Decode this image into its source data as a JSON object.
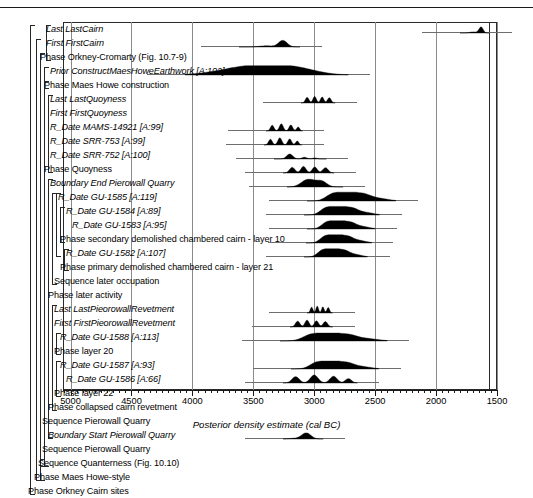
{
  "figure": {
    "x_caption": "Posterior density estimate (cal BC)",
    "axis": {
      "min": 1500,
      "max": 5200,
      "reversed": true,
      "major_ticks": [
        5000,
        4500,
        4000,
        3500,
        3000,
        2500,
        2000,
        1500
      ],
      "tick_labels": [
        "5000",
        "4500",
        "4000",
        "3500",
        "3000",
        "2500",
        "2000",
        "1500"
      ],
      "minor_tick_step": 50
    },
    "gridlines": [
      5000,
      4500,
      4000,
      3500,
      3000,
      2500,
      2000,
      1500
    ]
  },
  "chart_data": {
    "type": "line",
    "title": "",
    "subtitle": "",
    "xlabel": "Posterior density estimate (cal BC)",
    "ylabel": "",
    "xlim": [
      5200,
      1500
    ],
    "grid": true,
    "legend": null,
    "note": "OxCal Bayesian chronological model; each row is a posterior probability density (filled black) with a light tail marking the 95% range.",
    "categories": [
      "Last LastCairn",
      "First FirstCairn",
      "Phase Orkney-Cromarty (Fig. 10.7-9)",
      "Prior ConstructMaesHoweEarthwork [A:102]",
      "Phase Maes Howe construction",
      "Last LastQuoyness",
      "First FirstQuoyness",
      "R_Date MAMS-14921 [A:99]",
      "R_Date SRR-753 [A:99]",
      "R_Date SRR-752 [A:100]",
      "Phase Quoyness",
      "Boundary End Pierowall Quarry",
      "R_Date GU-1585 [A:119]",
      "R_Date GU-1584 [A:89]",
      "R_Date GU-1583 [A:95]",
      "Phase secondary demolished chambered cairn - layer 10",
      "R_Date GU-1582 [A:107]",
      "Phase primary demolished chambered cairn - layer 21",
      "Sequence later occupation",
      "Phase later activity",
      "Last LastPieorowallRevetment",
      "First FirstPieorowallRevetment",
      "R_Date GU-1588 [A:113]",
      "Phase layer 20",
      "R_Date GU-1587 [A:93]",
      "R_Date GU-1586 [A:66]",
      "Phase layer 22",
      "Phase collapsed cairn revetment",
      "Sequence Pierowall Quarry",
      "Boundary Start Pierowall Quarry",
      "Sequence Pierowall Quarry",
      "Sequence Quanterness (Fig. 10.10)",
      "Phase Maes Howe-style",
      "Phase Orkney Cairn sites"
    ],
    "series": [
      {
        "name": "Last LastCairn",
        "peak": 1650,
        "range95": [
          1800,
          1560
        ],
        "height": 0.55
      },
      {
        "name": "First FirstCairn",
        "peak": 3190,
        "range95": [
          3620,
          3120
        ],
        "height": 0.6
      },
      {
        "name": "Prior ConstructMaesHoweEarthwork [A:102]",
        "peak": 3180,
        "range95": [
          4060,
          2720
        ],
        "height": 0.85
      },
      {
        "name": "Last LastQuoyness",
        "peak": 2930,
        "range95": [
          3110,
          2830
        ],
        "height": 0.6
      },
      {
        "name": "R_Date MAMS-14921 [A:99]",
        "peak": 3330,
        "range95": [
          3400,
          3100
        ],
        "height": 0.65
      },
      {
        "name": "R_Date SRR-753 [A:99]",
        "peak": 3330,
        "range95": [
          3410,
          3100
        ],
        "height": 0.65
      },
      {
        "name": "R_Date SRR-752 [A:100]",
        "peak": 2980,
        "range95": [
          3330,
          2900
        ],
        "height": 0.45
      },
      {
        "name": "Boundary End Pierowall Quarry",
        "peak": 2950,
        "range95": [
          3220,
          2840
        ],
        "height": 0.65
      },
      {
        "name": "R_Date GU-1585 [A:119]",
        "peak": 2870,
        "range95": [
          3060,
          2620
        ],
        "height": 0.8
      },
      {
        "name": "R_Date GU-1584 [A:89]",
        "peak": 2890,
        "range95": [
          3080,
          2300
        ],
        "height": 0.8
      },
      {
        "name": "R_Date GU-1583 [A:95]",
        "peak": 2880,
        "range95": [
          3060,
          2450
        ],
        "height": 0.75
      },
      {
        "name": "R_Date GU-1582 [A:107]",
        "peak": 2870,
        "range95": [
          3070,
          2560
        ],
        "height": 0.75
      },
      {
        "name": "Sequence later occupation",
        "peak": 2890,
        "range95": [
          3070,
          2590
        ],
        "height": 0.8
      },
      {
        "name": "Last LastPieorowallRevetment",
        "peak": 2940,
        "range95": [
          3060,
          2850
        ],
        "height": 0.65
      },
      {
        "name": "First FirstPieorowallRevetment",
        "peak": 2930,
        "range95": [
          3200,
          2850
        ],
        "height": 0.65
      },
      {
        "name": "R_Date GU-1588 [A:113]",
        "peak": 2930,
        "range95": [
          3280,
          2400
        ],
        "height": 0.7
      },
      {
        "name": "R_Date GU-1587 [A:93]",
        "peak": 2930,
        "range95": [
          3190,
          2470
        ],
        "height": 0.7
      },
      {
        "name": "R_Date GU-1586 [A:66]",
        "peak": 2930,
        "range95": [
          3260,
          2650
        ],
        "height": 0.7
      },
      {
        "name": "Boundary Start Pierowall Quarry",
        "peak": 3030,
        "range95": [
          3260,
          2930
        ],
        "height": 0.55
      }
    ]
  },
  "rows": [
    {
      "label": "Last LastCairn",
      "italic": true,
      "indent": 46,
      "dist": {
        "mode": "narrow",
        "peak": 1650,
        "left": 1800,
        "right": 1560,
        "h": 0.55
      }
    },
    {
      "label": "First FirstCairn",
      "italic": true,
      "indent": 46,
      "dist": {
        "mode": "narrow",
        "peak": 3190,
        "left": 3620,
        "right": 3120,
        "h": 0.6
      }
    },
    {
      "label": "Phase Orkney-Cromarty (Fig. 10.7-9)",
      "italic": false,
      "indent": 40,
      "dist": null
    },
    {
      "label": "Prior ConstructMaesHoweEarthwork [A:102]",
      "italic": true,
      "indent": 50,
      "dist": {
        "mode": "wide",
        "peak": 3180,
        "left": 4060,
        "right": 2720,
        "h": 0.85
      }
    },
    {
      "label": "Phase Maes Howe construction",
      "italic": false,
      "indent": 44,
      "dist": null
    },
    {
      "label": "Last LastQuoyness",
      "italic": true,
      "indent": 50,
      "dist": {
        "mode": "bumpy",
        "peak": 2930,
        "left": 3110,
        "right": 2830,
        "h": 0.6
      }
    },
    {
      "label": "First FirstQuoyness",
      "italic": true,
      "indent": 50,
      "dist": null
    },
    {
      "label": "R_Date MAMS-14921 [A:99]",
      "italic": true,
      "indent": 50,
      "dist": {
        "mode": "tri",
        "peak": 3330,
        "left": 3400,
        "right": 3100,
        "h": 0.65
      }
    },
    {
      "label": "R_Date SRR-753 [A:99]",
      "italic": true,
      "indent": 50,
      "dist": {
        "mode": "tri",
        "peak": 3330,
        "left": 3410,
        "right": 3100,
        "h": 0.65
      }
    },
    {
      "label": "R_Date SRR-752 [A:100]",
      "italic": true,
      "indent": 50,
      "dist": {
        "mode": "small",
        "peak": 2980,
        "left": 3330,
        "right": 2900,
        "h": 0.45
      }
    },
    {
      "label": "Phase Quoyness",
      "italic": false,
      "indent": 44,
      "dist": {
        "mode": "bumpy",
        "peak": 2940,
        "left": 3260,
        "right": 2840,
        "h": 0.6
      }
    },
    {
      "label": "Boundary End Pierowall Quarry",
      "italic": true,
      "indent": 50,
      "dist": {
        "mode": "broad",
        "peak": 2950,
        "left": 3220,
        "right": 2760,
        "h": 0.7
      }
    },
    {
      "label": "R_Date GU-1585 [A:119]",
      "italic": true,
      "indent": 58,
      "dist": {
        "mode": "broad2",
        "peak": 2870,
        "left": 3060,
        "right": 2330,
        "h": 0.8
      }
    },
    {
      "label": "R_Date GU-1584 [A:89]",
      "italic": true,
      "indent": 66,
      "dist": {
        "mode": "broad2",
        "peak": 2890,
        "left": 3080,
        "right": 2460,
        "h": 0.78
      }
    },
    {
      "label": "R_Date GU-1583 [A:95]",
      "italic": true,
      "indent": 72,
      "dist": {
        "mode": "broad2",
        "peak": 2880,
        "left": 3060,
        "right": 2500,
        "h": 0.75
      }
    },
    {
      "label": "Phase secondary demolished chambered cairn - layer 10",
      "italic": false,
      "indent": 60,
      "dist": {
        "mode": "broad2",
        "peak": 2870,
        "left": 3070,
        "right": 2530,
        "h": 0.75
      }
    },
    {
      "label": "R_Date GU-1582 [A:107]",
      "italic": true,
      "indent": 66,
      "dist": {
        "mode": "broad2",
        "peak": 2870,
        "left": 3080,
        "right": 2560,
        "h": 0.75
      }
    },
    {
      "label": "Phase primary demolished chambered cairn - layer 21",
      "italic": false,
      "indent": 60,
      "dist": null
    },
    {
      "label": "Sequence later occupation",
      "italic": false,
      "indent": 54,
      "dist": null
    },
    {
      "label": "Phase later activity",
      "italic": false,
      "indent": 48,
      "dist": null
    },
    {
      "label": "Last LastPieorowallRevetment",
      "italic": true,
      "indent": 54,
      "dist": {
        "mode": "bumpy",
        "peak": 2940,
        "left": 3060,
        "right": 2850,
        "h": 0.62
      }
    },
    {
      "label": "First FirstPieorowallRevetment",
      "italic": true,
      "indent": 54,
      "dist": {
        "mode": "bumpy",
        "peak": 2930,
        "left": 3200,
        "right": 2850,
        "h": 0.62
      }
    },
    {
      "label": "R_Date GU-1588 [A:113]",
      "italic": true,
      "indent": 60,
      "dist": {
        "mode": "broad2",
        "peak": 2930,
        "left": 3280,
        "right": 2400,
        "h": 0.72
      }
    },
    {
      "label": "Phase layer 20",
      "italic": false,
      "indent": 54,
      "dist": null
    },
    {
      "label": "R_Date GU-1587 [A:93]",
      "italic": true,
      "indent": 60,
      "dist": {
        "mode": "broad2",
        "peak": 2930,
        "left": 3190,
        "right": 2470,
        "h": 0.72
      }
    },
    {
      "label": "R_Date GU-1586 [A:66]",
      "italic": true,
      "indent": 66,
      "dist": {
        "mode": "tri",
        "peak": 2930,
        "left": 3260,
        "right": 2650,
        "h": 0.72
      }
    },
    {
      "label": "Phase layer 22",
      "italic": false,
      "indent": 54,
      "dist": null
    },
    {
      "label": "Phase collapsed cairn revetment",
      "italic": false,
      "indent": 48,
      "dist": null
    },
    {
      "label": "Sequence Pierowall Quarry",
      "italic": false,
      "indent": 42,
      "dist": null
    },
    {
      "label": "Boundary Start Pierowall Quarry",
      "italic": true,
      "indent": 48,
      "dist": {
        "mode": "narrow2",
        "peak": 3030,
        "left": 3260,
        "right": 2930,
        "h": 0.55
      }
    },
    {
      "label": "Sequence Pierowall Quarry",
      "italic": false,
      "indent": 42,
      "dist": null
    },
    {
      "label": "Sequence Quanterness (Fig. 10.10)",
      "italic": false,
      "indent": 38,
      "dist": null
    },
    {
      "label": "Phase Maes Howe-style",
      "italic": false,
      "indent": 34,
      "dist": null
    },
    {
      "label": "Phase Orkney Cairn sites",
      "italic": false,
      "indent": 28,
      "dist": null
    }
  ],
  "brackets": [
    {
      "x": 30,
      "top": 0,
      "rows": 33
    },
    {
      "x": 36,
      "top": 1,
      "rows": 31
    },
    {
      "x": 40,
      "top": 2,
      "rows": 30
    },
    {
      "x": 44,
      "top": 3,
      "rows": 1
    },
    {
      "x": 46,
      "top": 0,
      "rows": 2
    },
    {
      "x": 44,
      "top": 4,
      "rows": 27
    },
    {
      "x": 48,
      "top": 5,
      "rows": 5
    },
    {
      "x": 48,
      "top": 11,
      "rows": 18
    },
    {
      "x": 52,
      "top": 12,
      "rows": 6
    },
    {
      "x": 56,
      "top": 12,
      "rows": 4
    },
    {
      "x": 60,
      "top": 13,
      "rows": 2
    },
    {
      "x": 64,
      "top": 16,
      "rows": 1
    },
    {
      "x": 52,
      "top": 20,
      "rows": 7
    },
    {
      "x": 56,
      "top": 22,
      "rows": 1
    },
    {
      "x": 56,
      "top": 24,
      "rows": 2
    },
    {
      "x": 40,
      "top": 31,
      "rows": 0
    }
  ]
}
